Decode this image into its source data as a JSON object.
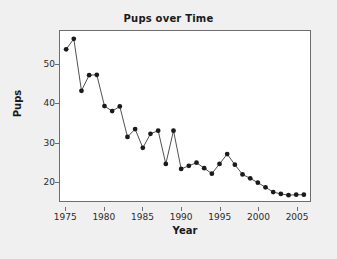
{
  "chart_data": {
    "type": "line",
    "title": "Pups over Time",
    "xlabel": "Year",
    "ylabel": "Pups",
    "grid": false,
    "legend": false,
    "marker": "filled-circle",
    "marker_color": "#1a1a1a",
    "line_color": "#3c3c3c",
    "xlim": [
      1974.2,
      2006.8
    ],
    "ylim": [
      15.0,
      58.5
    ],
    "xticks": [
      1975,
      1980,
      1985,
      1990,
      1995,
      2000,
      2005
    ],
    "yticks": [
      20,
      30,
      40,
      50
    ],
    "xtick_labels": [
      "1975",
      "1980",
      "1985",
      "1990",
      "1995",
      "2000",
      "2005"
    ],
    "ytick_labels": [
      "20",
      "30",
      "40",
      "50"
    ],
    "x": [
      1975,
      1976,
      1977,
      1978,
      1979,
      1980,
      1981,
      1982,
      1983,
      1984,
      1985,
      1986,
      1987,
      1988,
      1989,
      1990,
      1991,
      1992,
      1993,
      1994,
      1995,
      1996,
      1997,
      1998,
      1999,
      2000,
      2001,
      2002,
      2003,
      2004,
      2005,
      2006
    ],
    "values": [
      53.8,
      56.5,
      43.2,
      47.2,
      47.3,
      39.3,
      38.0,
      39.2,
      31.4,
      33.4,
      28.6,
      32.2,
      33.0,
      24.5,
      33.0,
      23.2,
      24.0,
      24.8,
      23.4,
      22.0,
      24.5,
      27.0,
      24.3,
      21.8,
      20.8,
      19.7,
      18.5,
      17.3,
      16.8,
      16.5,
      16.6,
      16.6
    ]
  },
  "figure": {
    "background_color": "#f0f0f0",
    "plot_background_color": "#ffffff",
    "frame_color": "#6e6e6e"
  }
}
